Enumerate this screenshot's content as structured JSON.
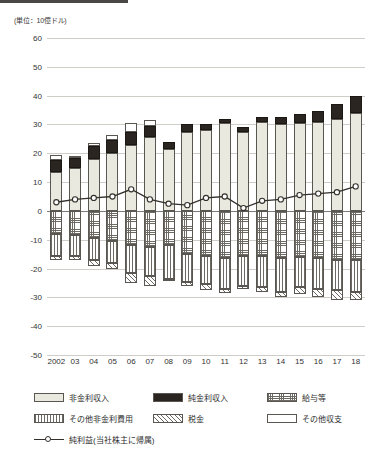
{
  "unit_label": "(単位：10億ドル)",
  "axis": {
    "y_ticks": [
      "60",
      "50",
      "40",
      "30",
      "20",
      "10",
      "0",
      "-10",
      "-20",
      "-30",
      "-40",
      "-50"
    ],
    "x_ticks": [
      "2002",
      "03",
      "04",
      "05",
      "06",
      "07",
      "08",
      "09",
      "10",
      "11",
      "12",
      "13",
      "14",
      "15",
      "16",
      "17",
      "18"
    ]
  },
  "legend": {
    "items": [
      {
        "key": "nonint",
        "label": "非金利収入",
        "swatch": "f-nonint"
      },
      {
        "key": "netint",
        "label": "純金利収入",
        "swatch": "f-netint"
      },
      {
        "key": "salary",
        "label": "給与等",
        "swatch": "f-salary"
      },
      {
        "key": "nonintexp",
        "label": "その他非金利費用",
        "swatch": "f-nonintexp"
      },
      {
        "key": "tax",
        "label": "税金",
        "swatch": "f-tax"
      },
      {
        "key": "other",
        "label": "その他収支",
        "swatch": "f-other"
      },
      {
        "key": "netincome",
        "label": "純利益(当社株主に帰属)",
        "swatch": "line"
      }
    ]
  },
  "chart_data": {
    "type": "bar",
    "title": "",
    "subtitle": "",
    "xlabel": "",
    "ylabel": "(単位：10億ドル)",
    "ylim": [
      -50,
      60
    ],
    "ytick_step": 10,
    "grid": true,
    "stacked": true,
    "legend_position": "bottom",
    "categories": [
      "2002",
      "03",
      "04",
      "05",
      "06",
      "07",
      "08",
      "09",
      "10",
      "11",
      "12",
      "13",
      "14",
      "15",
      "16",
      "17",
      "18"
    ],
    "series": [
      {
        "name": "非金利収入",
        "key": "nonint",
        "direction": "positive",
        "values": [
          13.5,
          15.0,
          18.0,
          20.0,
          23.0,
          25.5,
          21.5,
          27.5,
          28.0,
          30.5,
          27.5,
          31.0,
          30.0,
          30.5,
          31.0,
          32.0,
          34.0
        ]
      },
      {
        "name": "純金利収入",
        "key": "netint",
        "direction": "positive",
        "values": [
          4.0,
          3.5,
          4.5,
          4.5,
          4.5,
          4.0,
          2.5,
          2.5,
          2.0,
          1.5,
          1.5,
          1.5,
          2.5,
          3.0,
          3.5,
          5.0,
          6.0
        ]
      },
      {
        "name": "その他収支",
        "key": "other",
        "direction": "positive",
        "values": [
          2.0,
          0.5,
          1.0,
          2.0,
          3.0,
          2.0,
          0.0,
          0.0,
          0.0,
          0.0,
          0.0,
          0.0,
          0.0,
          0.0,
          0.0,
          0.0,
          0.0
        ]
      },
      {
        "name": "給与等",
        "key": "salary",
        "direction": "negative",
        "values": [
          -8.0,
          -8.5,
          -9.5,
          -10.5,
          -12.0,
          -12.5,
          -12.0,
          -15.0,
          -15.5,
          -16.5,
          -15.5,
          -15.5,
          -16.5,
          -16.0,
          -16.5,
          -17.0,
          -17.0
        ]
      },
      {
        "name": "その他非金利費用",
        "key": "nonintexp",
        "direction": "negative",
        "values": [
          -7.5,
          -7.0,
          -7.5,
          -7.5,
          -9.5,
          -10.0,
          -11.5,
          -9.5,
          -10.0,
          -10.5,
          -10.5,
          -11.0,
          -11.5,
          -10.5,
          -10.5,
          -10.5,
          -11.0
        ]
      },
      {
        "name": "税金",
        "key": "tax",
        "direction": "negative",
        "values": [
          -1.5,
          -1.5,
          -2.0,
          -2.0,
          -3.5,
          -3.5,
          -0.5,
          -1.5,
          -2.0,
          -1.5,
          -1.0,
          -1.5,
          -2.0,
          -2.5,
          -3.0,
          -3.5,
          -3.0
        ]
      }
    ],
    "line_series": {
      "name": "純利益(当社株主に帰属)",
      "key": "netincome",
      "values": [
        3.0,
        4.0,
        4.5,
        5.0,
        7.5,
        4.0,
        2.5,
        2.0,
        4.5,
        5.0,
        1.0,
        3.5,
        4.0,
        5.5,
        6.0,
        6.5,
        8.5
      ]
    }
  }
}
